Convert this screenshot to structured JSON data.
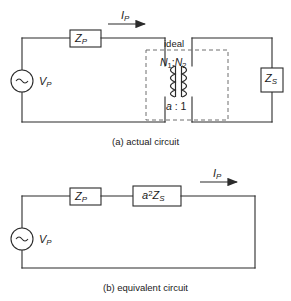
{
  "figure": {
    "stroke_color": "#2b2b2b",
    "background": "#ffffff"
  },
  "circuit_a": {
    "caption": "(a) actual circuit",
    "source": {
      "name": "ac-voltage-source",
      "symbol": "~",
      "label_v": "V",
      "label_v_sub": "P"
    },
    "series_impedance": {
      "label_z": "Z",
      "label_z_sub": "P"
    },
    "current": {
      "label_i": "I",
      "label_i_sub": "P"
    },
    "transformer": {
      "ideal_label": "ideal",
      "turns_n1": "N",
      "turns_n1_sub": "1",
      "turns_colon": ":",
      "turns_n2": "N",
      "turns_n2_sub": "2",
      "ratio_a": "a",
      "ratio_colon": ":",
      "ratio_one": "1"
    },
    "load_impedance": {
      "label_z": "Z",
      "label_z_sub": "S"
    }
  },
  "circuit_b": {
    "caption": "(b) equivalent circuit",
    "source": {
      "symbol": "~",
      "label_v": "V",
      "label_v_sub": "P"
    },
    "series_impedance": {
      "label_z": "Z",
      "label_z_sub": "P"
    },
    "reflected_impedance": {
      "label_a": "a",
      "label_exp": "2",
      "label_z": "Z",
      "label_z_sub": "S"
    },
    "current": {
      "label_i": "I",
      "label_i_sub": "P"
    }
  }
}
